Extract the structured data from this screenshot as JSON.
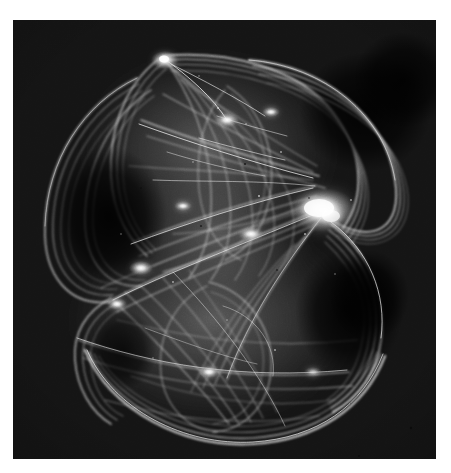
{
  "figure": {
    "kind": "strange-attractor-plot",
    "title": "",
    "caption": "",
    "plate": {
      "background_color": "#141414",
      "page_color": "#ffffff",
      "stroke_color": "#e8e8e8",
      "left": 13,
      "top": 20,
      "width": 423,
      "height": 439
    }
  },
  "chart_data": {
    "type": "scatter",
    "title": "",
    "subtitle": "",
    "xlabel": "",
    "ylabel": "",
    "grid": false,
    "legend": null,
    "colormap": "grayscale",
    "background": "#141414",
    "ink": "#e8e8e8",
    "xlim": [
      -1.15,
      1.15
    ],
    "ylim": [
      -1.2,
      1.2
    ],
    "features": [
      {
        "name": "upper-lobe",
        "center_xy": [
          0.02,
          0.46
        ],
        "radius_xy": [
          0.7,
          0.52
        ]
      },
      {
        "name": "lower-lobe",
        "center_xy": [
          -0.02,
          -0.44
        ],
        "radius_xy": [
          0.78,
          0.5
        ]
      },
      {
        "name": "apex-cusp",
        "xy": [
          -0.33,
          1.08
        ],
        "brightness": 0.95
      },
      {
        "name": "right-caustic-knot",
        "xy": [
          0.7,
          0.25
        ],
        "brightness": 1.0
      },
      {
        "name": "left-teardrop-loop",
        "xy": [
          -0.82,
          0.18
        ],
        "brightness": 0.55
      },
      {
        "name": "lower-right-void",
        "xy": [
          0.55,
          -0.35
        ],
        "brightness": 0.05
      },
      {
        "name": "upper-right-void",
        "xy": [
          0.72,
          0.72
        ],
        "brightness": 0.05
      },
      {
        "name": "center-waist",
        "xy": [
          0.05,
          0.02
        ],
        "brightness": 0.62
      }
    ],
    "arc_families": [
      {
        "name": "outer-left-envelope",
        "count": 6,
        "brightness": 0.6
      },
      {
        "name": "outer-right-envelope",
        "count": 7,
        "brightness": 0.75
      },
      {
        "name": "upper-meridians",
        "count": 9,
        "brightness": 0.55
      },
      {
        "name": "lower-meridians",
        "count": 11,
        "brightness": 0.58
      },
      {
        "name": "cross-chords",
        "count": 14,
        "brightness": 0.7
      },
      {
        "name": "bottom-rim",
        "count": 5,
        "brightness": 0.8
      }
    ],
    "point_density_note": "Brightness encodes visit frequency; caustic folds appear as near-white filaments."
  }
}
